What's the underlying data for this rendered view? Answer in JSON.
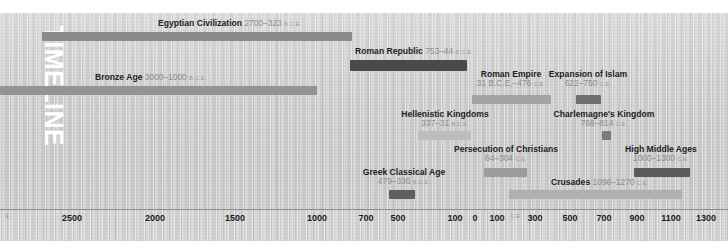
{
  "title_vertical": "TIMELINE",
  "axis": {
    "ticks": [
      {
        "label": "E",
        "x": 7,
        "style": "small"
      },
      {
        "label": "2500",
        "x": 72,
        "style": "normal"
      },
      {
        "label": "2000",
        "x": 155,
        "style": "normal"
      },
      {
        "label": "1500",
        "x": 235,
        "style": "normal"
      },
      {
        "label": "1000",
        "x": 317,
        "style": "normal"
      },
      {
        "label": "700",
        "x": 366,
        "style": "normal"
      },
      {
        "label": "500",
        "x": 398,
        "style": "normal"
      },
      {
        "label": "100",
        "x": 455,
        "style": "normal"
      },
      {
        "label": "0",
        "x": 475,
        "style": "normal"
      },
      {
        "label": "100",
        "x": 497,
        "style": "normal"
      },
      {
        "label": "C.E.",
        "x": 516,
        "style": "small"
      },
      {
        "label": "300",
        "x": 535,
        "style": "normal"
      },
      {
        "label": "500",
        "x": 570,
        "style": "normal"
      },
      {
        "label": "700",
        "x": 604,
        "style": "normal"
      },
      {
        "label": "900",
        "x": 637,
        "style": "normal"
      },
      {
        "label": "1100",
        "x": 671,
        "style": "normal"
      },
      {
        "label": "1300",
        "x": 706,
        "style": "normal"
      }
    ]
  },
  "events": [
    {
      "id": "egyptian-civilization",
      "name": "Egyptian Civilization",
      "date": "2700–323",
      "era": "B.C.E.",
      "bar": {
        "x": 42,
        "y": 32,
        "w": 310,
        "h": 9,
        "color": "#8a8a8a"
      },
      "label": {
        "x": 158,
        "y": 19,
        "align": "left"
      }
    },
    {
      "id": "bronze-age",
      "name": "Bronze Age",
      "date": "3000–1000",
      "era": "B.C.E.",
      "bar": {
        "x": 0,
        "y": 86,
        "w": 317,
        "h": 9,
        "color": "#939393"
      },
      "label": {
        "x": 95,
        "y": 73,
        "align": "left"
      }
    },
    {
      "id": "roman-republic",
      "name": "Roman Republic",
      "date": "753–44",
      "era": "B.C.E.",
      "bar": {
        "x": 350,
        "y": 60,
        "w": 117,
        "h": 11,
        "color": "#4a4a4a"
      },
      "label": {
        "x": 355,
        "y": 47,
        "align": "left"
      }
    },
    {
      "id": "roman-empire",
      "name": "Roman Empire",
      "date": "31 B.C.E.–476",
      "era": "C.E.",
      "bar": {
        "x": 472,
        "y": 95,
        "w": 79,
        "h": 9,
        "color": "#a3a3a3"
      },
      "label": {
        "x": 511,
        "y": 70,
        "align": "center"
      }
    },
    {
      "id": "expansion-of-islam",
      "name": "Expansion of Islam",
      "date": "622–750",
      "era": "C.E.",
      "bar": {
        "x": 576,
        "y": 95,
        "w": 25,
        "h": 9,
        "color": "#6f6f6f"
      },
      "label": {
        "x": 588,
        "y": 70,
        "align": "center"
      }
    },
    {
      "id": "hellenistic-kingdoms",
      "name": "Hellenistic Kingdoms",
      "date": "337–31",
      "era": "B.C.E.",
      "bar": {
        "x": 418,
        "y": 131,
        "w": 53,
        "h": 9,
        "color": "#bdbdbd"
      },
      "label": {
        "x": 445,
        "y": 110,
        "align": "center"
      }
    },
    {
      "id": "charlemagnes-kingdom",
      "name": "Charlemagne's Kingdom",
      "date": "768–814",
      "era": "C.E.",
      "bar": {
        "x": 602,
        "y": 131,
        "w": 9,
        "h": 9,
        "color": "#7c7c7c"
      },
      "label": {
        "x": 604,
        "y": 110,
        "align": "center"
      }
    },
    {
      "id": "persecution-of-christians",
      "name": "Persecution of Christians",
      "date": "64–304",
      "era": "C.E.",
      "bar": {
        "x": 484,
        "y": 168,
        "w": 43,
        "h": 9,
        "color": "#9c9c9c"
      },
      "label": {
        "x": 506,
        "y": 145,
        "align": "center"
      }
    },
    {
      "id": "high-middle-ages",
      "name": "High Middle Ages",
      "date": "1000–1300",
      "era": "C.E.",
      "bar": {
        "x": 634,
        "y": 168,
        "w": 56,
        "h": 9,
        "color": "#5a5a5a"
      },
      "label": {
        "x": 661,
        "y": 145,
        "align": "center"
      }
    },
    {
      "id": "greek-classical-age",
      "name": "Greek Classical Age",
      "date": "479–336",
      "era": "B.C.E.",
      "bar": {
        "x": 389,
        "y": 190,
        "w": 26,
        "h": 9,
        "color": "#5f5f5f"
      },
      "label": {
        "x": 404,
        "y": 168,
        "align": "center"
      }
    },
    {
      "id": "crusades",
      "name": "Crusades",
      "date": "1096–1270",
      "era": "C.E.",
      "bar": {
        "x": 509,
        "y": 190,
        "w": 173,
        "h": 9,
        "color": "#b0b0b0"
      },
      "label": {
        "x": 551,
        "y": 178,
        "align": "left"
      }
    }
  ]
}
